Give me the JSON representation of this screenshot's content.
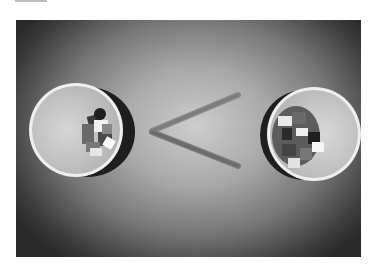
{
  "image": {
    "kind": "photograph",
    "tone": "grayscale",
    "subject": "Two paper cups with colored blocks viewed from above, separated by two popsicle sticks forming a less-than sign",
    "symbol": "<",
    "colors": {
      "page_background": "#ffffff",
      "vignette_dark": "#2a2a2a",
      "center_light": "#cdcdcd",
      "cup_rim": "#f2f2f2",
      "cup_inner": "#c9c9c9",
      "stick": "#6e6e6e"
    },
    "cups": [
      {
        "position": "left",
        "content": "small blocks (fewer)"
      },
      {
        "position": "right",
        "content": "small blocks (more)"
      }
    ]
  }
}
